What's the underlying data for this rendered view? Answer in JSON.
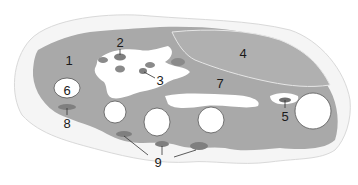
{
  "diagram": {
    "type": "anatomical cross-section",
    "colors": {
      "background": "#ffffff",
      "outline_region": "#f4f4f4",
      "outline_stroke": "#d8d8d8",
      "tissue": "#a8a8a8",
      "dark_spots": "#7e7e7e",
      "void": "#ffffff",
      "leader": "#333333",
      "label": "#1a1a1a"
    },
    "labels": [
      {
        "id": "1",
        "text": "1"
      },
      {
        "id": "2",
        "text": "2"
      },
      {
        "id": "3",
        "text": "3"
      },
      {
        "id": "4",
        "text": "4"
      },
      {
        "id": "5",
        "text": "5"
      },
      {
        "id": "6",
        "text": "6"
      },
      {
        "id": "7",
        "text": "7"
      },
      {
        "id": "8",
        "text": "8"
      },
      {
        "id": "9",
        "text": "9"
      }
    ]
  }
}
